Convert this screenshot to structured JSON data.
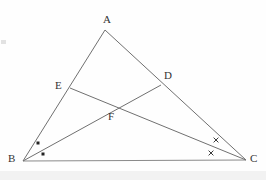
{
  "figure": {
    "type": "euclidean-geometry-diagram",
    "canvas": {
      "width": 266,
      "height": 180
    },
    "colors": {
      "background": "#fefefe",
      "stroke": "#707070",
      "label": "#333333",
      "mark": "#222222",
      "band": "#f2f2f2"
    },
    "stroke_width": 1,
    "points": {
      "A": {
        "x": 105,
        "y": 30,
        "label": "A",
        "label_x": 103,
        "label_y": 14
      },
      "B": {
        "x": 23,
        "y": 161,
        "label": "B",
        "label_x": 8,
        "label_y": 153
      },
      "C": {
        "x": 246,
        "y": 160,
        "label": "C",
        "label_x": 250,
        "label_y": 153
      },
      "D": {
        "x": 161,
        "y": 85,
        "label": "D",
        "label_x": 164,
        "label_y": 70
      },
      "E": {
        "x": 70,
        "y": 88,
        "label": "E",
        "label_x": 55,
        "label_y": 80
      },
      "F": {
        "x": 113,
        "y": 106,
        "label": "F",
        "label_x": 108,
        "label_y": 111
      }
    },
    "segments": [
      {
        "name": "side-AB",
        "from": "A",
        "to": "B"
      },
      {
        "name": "side-AC",
        "from": "A",
        "to": "C"
      },
      {
        "name": "side-BC",
        "from": "B",
        "to": "C"
      },
      {
        "name": "cevian-BD",
        "from": "B",
        "to": "D"
      },
      {
        "name": "cevian-EC",
        "from": "E",
        "to": "C"
      }
    ],
    "angle_marks": [
      {
        "name": "angle-mark-b-upper",
        "kind": "dot",
        "x": 38,
        "y": 143,
        "at_vertex": "B"
      },
      {
        "name": "angle-mark-b-lower",
        "kind": "dot",
        "x": 43,
        "y": 154,
        "at_vertex": "B"
      },
      {
        "name": "angle-mark-c-upper",
        "kind": "cross",
        "x": 216,
        "y": 140,
        "at_vertex": "C",
        "glyph": "×"
      },
      {
        "name": "angle-mark-c-lower",
        "kind": "cross",
        "x": 211,
        "y": 153,
        "at_vertex": "C",
        "glyph": "×"
      }
    ]
  }
}
